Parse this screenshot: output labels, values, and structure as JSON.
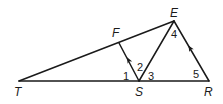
{
  "diagram": {
    "type": "geometry-triangle",
    "vertices": {
      "T": {
        "label": "T",
        "x": 19,
        "y": 81
      },
      "S": {
        "label": "S",
        "x": 139,
        "y": 81
      },
      "R": {
        "label": "R",
        "x": 209,
        "y": 81
      },
      "E": {
        "label": "E",
        "x": 174,
        "y": 21
      },
      "F": {
        "label": "F",
        "x": 119,
        "y": 43
      }
    },
    "segments": [
      "TR",
      "TE",
      "ER",
      "ES",
      "FS"
    ],
    "parallel_marks": [
      "FS",
      "ER"
    ],
    "angles": [
      {
        "label": "1"
      },
      {
        "label": "2"
      },
      {
        "label": "3"
      },
      {
        "label": "4"
      },
      {
        "label": "5"
      }
    ]
  }
}
